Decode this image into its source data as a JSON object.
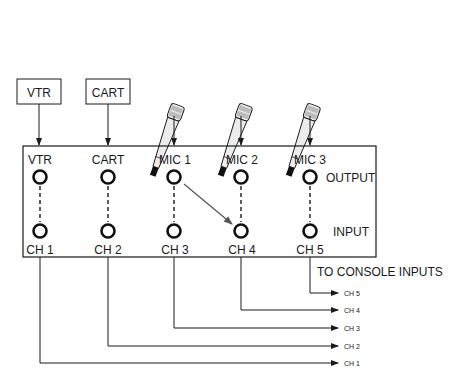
{
  "diagram": {
    "type": "patch-bay-routing",
    "colors": {
      "line": "#1a1a1a",
      "arrow": "#555555",
      "background": "#ffffff",
      "mic_body": "#e8e8e8"
    },
    "sources": [
      {
        "label": "VTR",
        "kind": "box"
      },
      {
        "label": "CART",
        "kind": "box"
      },
      {
        "label": "MIC 1",
        "kind": "microphone"
      },
      {
        "label": "MIC 2",
        "kind": "microphone"
      },
      {
        "label": "MIC 3",
        "kind": "microphone"
      }
    ],
    "patch_bay": {
      "columns": [
        {
          "top_label": "VTR",
          "bottom_label": "CH 1"
        },
        {
          "top_label": "CART",
          "bottom_label": "CH 2"
        },
        {
          "top_label": "MIC 1",
          "bottom_label": "CH 3"
        },
        {
          "top_label": "MIC 2",
          "bottom_label": "CH 4"
        },
        {
          "top_label": "MIC 3",
          "bottom_label": "CH 5"
        }
      ],
      "row_labels": {
        "output": "OUTPUT",
        "input": "INPUT"
      },
      "patch": {
        "from": "MIC 1 OUTPUT",
        "to": "CH 4 INPUT"
      }
    },
    "console": {
      "heading": "TO CONSOLE INPUTS",
      "channels": [
        "CH 5",
        "CH 4",
        "CH 3",
        "CH 2",
        "CH 1"
      ]
    }
  }
}
